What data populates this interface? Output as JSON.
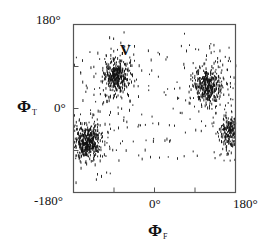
{
  "chart_data": {
    "type": "scatter",
    "title": "",
    "xlabel": "ΦF",
    "ylabel": "ΦT",
    "xlabel_symbol": "Φ",
    "xlabel_sub": "F",
    "ylabel_symbol": "Φ",
    "ylabel_sub": "T",
    "xlim": [
      -180,
      180
    ],
    "ylim": [
      -180,
      180
    ],
    "x_ticks": [
      -180,
      -90,
      0,
      90,
      180
    ],
    "y_ticks": [
      -180,
      -90,
      0,
      90,
      180
    ],
    "x_tick_labels": {
      "min": "-180°",
      "mid": "0°",
      "max": "180°"
    },
    "y_tick_labels": {
      "min": "-180°",
      "mid": "0°",
      "max": "180°"
    },
    "grid": false,
    "legend": null,
    "annotations": [
      {
        "text": "V",
        "x": -60,
        "y": 100
      }
    ],
    "clusters": [
      {
        "name": "V",
        "center": [
          -87,
          71
        ],
        "spread": [
          14,
          18
        ],
        "count": 320
      },
      {
        "name": "lower-left",
        "center": [
          -150,
          -70
        ],
        "spread": [
          14,
          18
        ],
        "count": 380
      },
      {
        "name": "upper-right",
        "center": [
          118,
          49
        ],
        "spread": [
          16,
          18
        ],
        "count": 330
      },
      {
        "name": "right-edge",
        "center": [
          166,
          -45
        ],
        "spread": [
          9,
          18
        ],
        "count": 170
      }
    ],
    "background_noise_count": 140
  },
  "labels": {
    "y_top": "180°",
    "y_mid": "0°",
    "y_bottom": "-180°",
    "x_mid": "0°",
    "x_right": "180°",
    "x_axis_symbol": "Φ",
    "x_axis_sub": "F",
    "y_axis_symbol": "Φ",
    "y_axis_sub": "T",
    "annotation_v": "V"
  },
  "colors": {
    "frame": "#555555",
    "points": "#111111"
  }
}
